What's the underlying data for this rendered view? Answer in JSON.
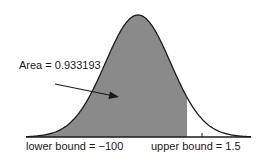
{
  "chart_data": {
    "type": "area",
    "title": "",
    "distribution": "standard normal",
    "mean": 0,
    "sd": 1,
    "lower_bound": -100,
    "upper_bound": 1.5,
    "shaded_area": 0.933193,
    "annotations": [
      {
        "text": "Area = 0.933193",
        "arrow_to": "shaded region"
      },
      {
        "text": "lower bound = −100",
        "position": "below axis, left"
      },
      {
        "text": "upper bound = 1.5",
        "position": "below axis, right"
      }
    ],
    "xlabel": "",
    "ylabel": "",
    "grid": false,
    "legend": null,
    "colors": {
      "fill": "#8a8a8a",
      "curve": "#1a1a1a",
      "axis": "#1a1a1a",
      "background": "#ffffff"
    }
  },
  "labels": {
    "area": "Area = 0.933193",
    "lower": "lower bound = −100",
    "upper": "upper bound = 1.5"
  },
  "geometry": {
    "mean_px": 138,
    "sd_px": 32.7,
    "baseline_px": 137,
    "peak_px": 15,
    "axis_start_px": 26,
    "axis_end_px": 251
  }
}
